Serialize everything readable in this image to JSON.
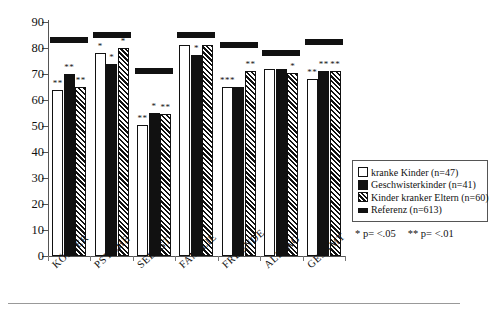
{
  "chart_data": {
    "type": "bar",
    "title": "",
    "subtitle": "",
    "xlabel": "",
    "ylabel": "",
    "ylim": [
      0,
      90
    ],
    "yticks": [
      0,
      10,
      20,
      30,
      40,
      50,
      60,
      70,
      80,
      90
    ],
    "grid": false,
    "legend_position": "right",
    "categories": [
      "KÖRPER",
      "PSYCHE",
      "SELBST",
      "FAMILIE",
      "FREUNDE",
      "ALLTAG",
      "GESAMT"
    ],
    "series": [
      {
        "name": "kranke Kinder (n=47)",
        "style": "open",
        "values": [
          64,
          78,
          50.5,
          81,
          65,
          72,
          68
        ],
        "significance": [
          "**",
          "*",
          "**",
          "",
          "***",
          "",
          "**"
        ]
      },
      {
        "name": "Geschwisterkinder (n=41)",
        "style": "solid",
        "values": [
          70,
          74,
          55,
          77.5,
          65,
          72,
          71
        ],
        "significance": [
          "**",
          "*",
          "*",
          "*",
          "",
          "",
          "**"
        ]
      },
      {
        "name": "Kinder kranker Eltern (n=60)",
        "style": "hatch",
        "values": [
          65,
          80,
          54.5,
          81,
          71,
          70.5,
          71
        ],
        "significance": [
          "**",
          "*",
          "**",
          "",
          "**",
          "*",
          "**"
        ]
      },
      {
        "name": "Referenz (n=613)",
        "style": "reference-bar",
        "values": [
          82,
          84,
          70,
          84,
          80,
          77,
          81
        ],
        "significance": [
          "",
          "",
          "",
          "",
          "",
          "",
          ""
        ]
      }
    ],
    "annotations": [
      "* p= <.05",
      "** p= <.01"
    ]
  },
  "legend": {
    "items": [
      {
        "label": "kranke Kinder (n=47)",
        "swatch": "open"
      },
      {
        "label": "Geschwisterkinder (n=41)",
        "swatch": "solid"
      },
      {
        "label": "Kinder kranker Eltern (n=60)",
        "swatch": "hatch"
      },
      {
        "label": "Referenz (n=613)",
        "swatch": "ref"
      }
    ]
  },
  "significance_note": {
    "one_star": "* p= <.05",
    "two_star": "** p= <.01"
  },
  "colors": {
    "ink": "#111111",
    "axis": "#555555",
    "background": "#ffffff"
  }
}
